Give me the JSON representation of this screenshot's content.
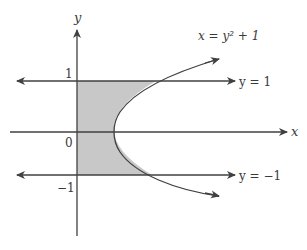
{
  "diagram": {
    "type": "region-between-curves",
    "axes": {
      "x_label": "x",
      "y_label": "y"
    },
    "tick_labels": {
      "one": "1",
      "zero": "0",
      "neg_one": "−1"
    },
    "curves": [
      {
        "id": "parabola",
        "label": "x = y² + 1",
        "equation": "x = y^2 + 1"
      },
      {
        "id": "line-top",
        "label": "y = 1",
        "equation": "y = 1"
      },
      {
        "id": "line-bottom",
        "label": "y = −1",
        "equation": "y = -1"
      }
    ],
    "shaded_region": "bounded by x = 0, y = 1, y = -1, and x = y^2 + 1",
    "colors": {
      "stroke": "#404040",
      "shade": "#c8c8c8",
      "background": "#ffffff"
    }
  }
}
